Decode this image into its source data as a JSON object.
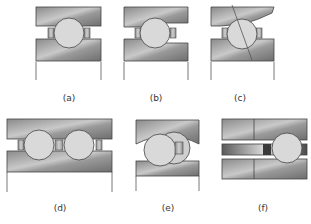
{
  "figure": {
    "panels": [
      {
        "id": "a",
        "label": "(a)"
      },
      {
        "id": "b",
        "label": "(b)"
      },
      {
        "id": "c",
        "label": "(c)"
      },
      {
        "id": "d",
        "label": "(d)"
      },
      {
        "id": "e",
        "label": "(e)"
      },
      {
        "id": "f",
        "label": "(f)"
      }
    ]
  },
  "colors": {
    "race_dark": "#7d7d7d",
    "race_light": "#c8c8c8",
    "ball": "#d9d9d9",
    "separator": "#a9a9a9",
    "outline": "#444444",
    "background": "#ffffff"
  }
}
